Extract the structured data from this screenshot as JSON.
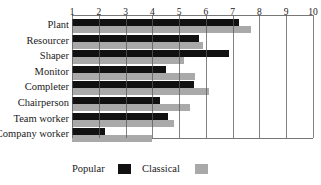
{
  "chart_data": {
    "type": "bar",
    "orientation": "horizontal",
    "title": "",
    "xlabel": "",
    "ylabel": "",
    "xlim": [
      1,
      10
    ],
    "x_ticks": [
      "1",
      "2",
      "3",
      "4",
      "5",
      "6",
      "7",
      "8",
      "9",
      "10"
    ],
    "x_axis_position": "top",
    "grid": true,
    "categories": [
      "Plant",
      "Resourcer",
      "Shaper",
      "Monitor",
      "Completer",
      "Chairperson",
      "Team worker",
      "Company worker"
    ],
    "series": [
      {
        "name": "Popular",
        "color": "#111111",
        "values": [
          7.25,
          5.75,
          6.85,
          4.5,
          5.55,
          4.3,
          4.6,
          2.25
        ]
      },
      {
        "name": "Classical",
        "color": "#a9a9a9",
        "values": [
          7.7,
          5.9,
          5.2,
          5.6,
          6.1,
          5.4,
          4.8,
          4.0
        ]
      }
    ],
    "legend": {
      "position": "bottom-left",
      "entries": [
        "Popular",
        "Classical"
      ]
    }
  }
}
